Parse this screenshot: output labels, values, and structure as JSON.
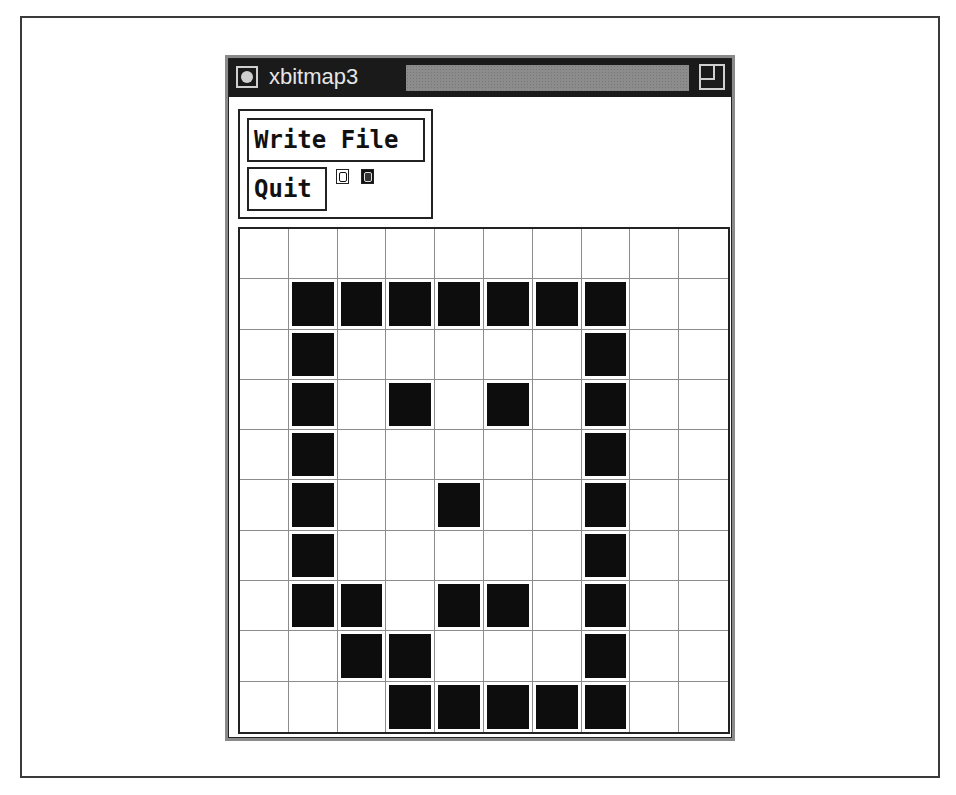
{
  "window": {
    "title": "xbitmap3",
    "icons": {
      "menu": "window-menu-circle-icon",
      "resize": "resize-corner-icon"
    }
  },
  "commands": {
    "write_file_label": "Write File",
    "quit_label": "Quit"
  },
  "preview_icons": [
    {
      "name": "bitmap-preview-normal-icon",
      "style": "normal"
    },
    {
      "name": "bitmap-preview-inverted-icon",
      "style": "inverted"
    }
  ],
  "bitmap": {
    "columns": 10,
    "rows": 10,
    "cells": [
      [
        0,
        0,
        0,
        0,
        0,
        0,
        0,
        0,
        0,
        0
      ],
      [
        0,
        1,
        1,
        1,
        1,
        1,
        1,
        1,
        0,
        0
      ],
      [
        0,
        1,
        0,
        0,
        0,
        0,
        0,
        1,
        0,
        0
      ],
      [
        0,
        1,
        0,
        1,
        0,
        1,
        0,
        1,
        0,
        0
      ],
      [
        0,
        1,
        0,
        0,
        0,
        0,
        0,
        1,
        0,
        0
      ],
      [
        0,
        1,
        0,
        0,
        1,
        0,
        0,
        1,
        0,
        0
      ],
      [
        0,
        1,
        0,
        0,
        0,
        0,
        0,
        1,
        0,
        0
      ],
      [
        0,
        1,
        1,
        0,
        1,
        1,
        0,
        1,
        0,
        0
      ],
      [
        0,
        0,
        1,
        1,
        0,
        0,
        0,
        1,
        0,
        0
      ],
      [
        0,
        0,
        0,
        1,
        1,
        1,
        1,
        1,
        0,
        0
      ]
    ]
  },
  "colors": {
    "titlebar_bg": "#1a1a1a",
    "title_text": "#e6e6e6",
    "cell_on": "#0d0d0d",
    "grid_line": "#8c8c8c"
  }
}
